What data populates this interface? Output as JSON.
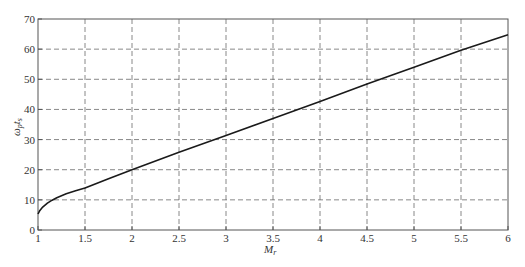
{
  "chart_data": {
    "type": "line",
    "title": "",
    "xlabel": "M_r",
    "ylabel": "ω_p t_s",
    "xlim": [
      1,
      6
    ],
    "ylim": [
      0,
      70
    ],
    "grid": true,
    "grid_style": "dashed",
    "legend": null,
    "x_ticks": [
      "1",
      "1.5",
      "2",
      "2.5",
      "3",
      "3.5",
      "4",
      "4.5",
      "5",
      "5.5",
      "6"
    ],
    "y_ticks": [
      "0",
      "10",
      "20",
      "30",
      "40",
      "50",
      "60",
      "70"
    ],
    "series": [
      {
        "name": "ω_p t_s vs M_r",
        "color": "#1a1a1a",
        "x": [
          1.0,
          1.02,
          1.05,
          1.1,
          1.15,
          1.2,
          1.3,
          1.4,
          1.5,
          1.75,
          2.0,
          2.5,
          3.0,
          3.5,
          4.0,
          4.5,
          5.0,
          5.5,
          6.0
        ],
        "y": [
          5.3,
          6.5,
          7.6,
          8.9,
          9.9,
          10.7,
          12.0,
          13.0,
          13.9,
          17.0,
          20.0,
          25.8,
          31.4,
          37.0,
          42.6,
          48.4,
          54.0,
          59.6,
          64.8
        ]
      }
    ]
  },
  "axes": {
    "x_label_main": "M",
    "x_label_sub": "r",
    "y_label_main1": "ω",
    "y_label_sub1": "p",
    "y_label_main2": "t",
    "y_label_sub2": "s"
  }
}
